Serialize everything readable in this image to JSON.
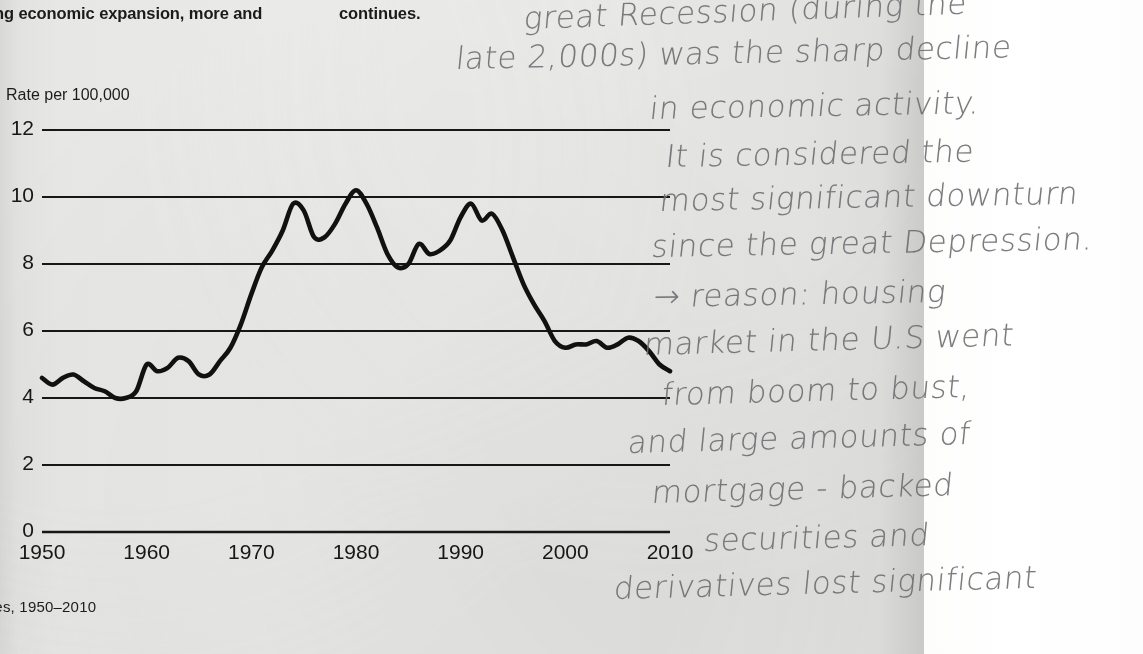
{
  "page": {
    "printed_text": {
      "left_column_fragment": "ng economic expansion, more and",
      "right_column_fragment": "continues.",
      "caption": "tes, 1950–2010"
    },
    "handwritten_note": {
      "full_text": "great Recession (during the late 2,000s) was the sharp decline in economic activity. It is considered the most significant downturn since the great Depression. → reason: housing market in the U.S went from boom to bust, and large amounts of mortgage-backed securities and derivatives lost significant",
      "lines": [
        {
          "text": "great Recession (during the",
          "x": 72,
          "y": 4,
          "size": 31,
          "rotate": -2.0
        },
        {
          "text": "late 2,000s) was the sharp decline",
          "x": 4,
          "y": 44,
          "size": 31,
          "rotate": -1.2
        },
        {
          "text": "in economic activity.",
          "x": 198,
          "y": 94,
          "size": 31,
          "rotate": -1.0
        },
        {
          "text": "It is considered the",
          "x": 214,
          "y": 142,
          "size": 31,
          "rotate": -1.0
        },
        {
          "text": "most significant downturn",
          "x": 208,
          "y": 186,
          "size": 31,
          "rotate": -1.0
        },
        {
          "text": "since the great Depression.",
          "x": 200,
          "y": 232,
          "size": 31,
          "rotate": -1.0
        },
        {
          "text": "→ reason: housing",
          "x": 202,
          "y": 282,
          "size": 31,
          "rotate": -1.0
        },
        {
          "text": "market in the U.S went",
          "x": 192,
          "y": 330,
          "size": 31,
          "rotate": -1.5
        },
        {
          "text": "from boom to bust,",
          "x": 210,
          "y": 380,
          "size": 31,
          "rotate": -1.5
        },
        {
          "text": "and large amounts of",
          "x": 176,
          "y": 428,
          "size": 31,
          "rotate": -1.5
        },
        {
          "text": "mortgage - backed",
          "x": 200,
          "y": 478,
          "size": 31,
          "rotate": -1.5
        },
        {
          "text": "securities and",
          "x": 252,
          "y": 526,
          "size": 31,
          "rotate": -1.5
        },
        {
          "text": "derivatives lost significant",
          "x": 162,
          "y": 574,
          "size": 31,
          "rotate": -1.5
        }
      ]
    }
  },
  "chart_data": {
    "type": "line",
    "title": "",
    "xlabel": "",
    "ylabel": "Rate per 100,000",
    "axis_label_top": "Rate per 100,000",
    "xlim": [
      1950,
      2010
    ],
    "ylim": [
      0,
      12
    ],
    "yticks": [
      0,
      2,
      4,
      6,
      8,
      10,
      12
    ],
    "xticks": [
      1950,
      1960,
      1970,
      1980,
      1990,
      2000,
      2010
    ],
    "grid": "horizontal",
    "legend": "none",
    "line_color": "#111111",
    "series": [
      {
        "name": "Rate per 100,000",
        "x": [
          1950,
          1951,
          1952,
          1953,
          1954,
          1955,
          1956,
          1957,
          1958,
          1959,
          1960,
          1961,
          1962,
          1963,
          1964,
          1965,
          1966,
          1967,
          1968,
          1969,
          1970,
          1971,
          1972,
          1973,
          1974,
          1975,
          1976,
          1977,
          1978,
          1979,
          1980,
          1981,
          1982,
          1983,
          1984,
          1985,
          1986,
          1987,
          1988,
          1989,
          1990,
          1991,
          1992,
          1993,
          1994,
          1995,
          1996,
          1997,
          1998,
          1999,
          2000,
          2001,
          2002,
          2003,
          2004,
          2005,
          2006,
          2007,
          2008,
          2009,
          2010
        ],
        "values": [
          4.6,
          4.4,
          4.6,
          4.7,
          4.5,
          4.3,
          4.2,
          4.0,
          4.0,
          4.2,
          5.0,
          4.8,
          4.9,
          5.2,
          5.1,
          4.7,
          4.7,
          5.1,
          5.5,
          6.2,
          7.1,
          7.9,
          8.4,
          9.0,
          9.8,
          9.6,
          8.8,
          8.8,
          9.2,
          9.8,
          10.2,
          9.8,
          9.1,
          8.3,
          7.9,
          8.0,
          8.6,
          8.3,
          8.4,
          8.7,
          9.4,
          9.8,
          9.3,
          9.5,
          9.0,
          8.2,
          7.4,
          6.8,
          6.3,
          5.7,
          5.5,
          5.6,
          5.6,
          5.7,
          5.5,
          5.6,
          5.8,
          5.7,
          5.4,
          5.0,
          4.8
        ]
      }
    ]
  }
}
